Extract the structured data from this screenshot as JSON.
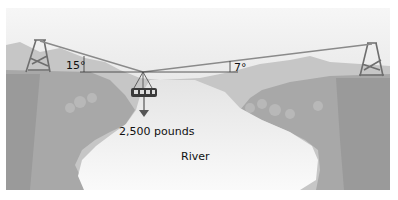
{
  "diagram": {
    "labels": {
      "angle_left": "15°",
      "angle_right": "7°",
      "weight": "2,500 pounds",
      "river": "River"
    },
    "colors": {
      "sky_top": "#f4f4f4",
      "sky_bottom": "#d9d9d9",
      "far_mountains": "#c4c4c4",
      "near_cliffs": "#a9a9a9",
      "cliff_face": "#9c9c9c",
      "river": "#f2f2f2",
      "cable": "#8a8a8a",
      "tower": "#6e6e6e",
      "reference_line": "#333333",
      "gondola": "#444444"
    }
  }
}
